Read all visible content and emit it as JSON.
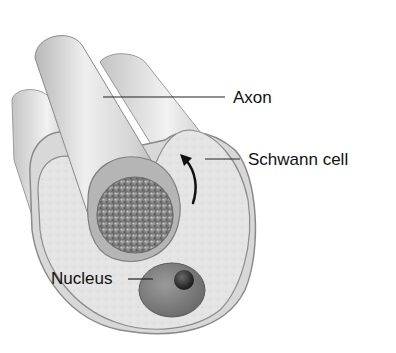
{
  "diagram": {
    "labels": {
      "axon": "Axon",
      "schwann_cell": "Schwann cell",
      "nucleus": "Nucleus"
    },
    "colors": {
      "background": "#ffffff",
      "tube_light": "#ececec",
      "tube_mid": "#c9c9c9",
      "tube_dark": "#9a9a9a",
      "cytoplasm": "#e3e3e3",
      "axon_core": "#8c8c8c",
      "nucleus": "#7d7d7d",
      "nucleolus": "#2e2e2e",
      "label_text": "#111111",
      "leader_line": "#222222"
    }
  }
}
